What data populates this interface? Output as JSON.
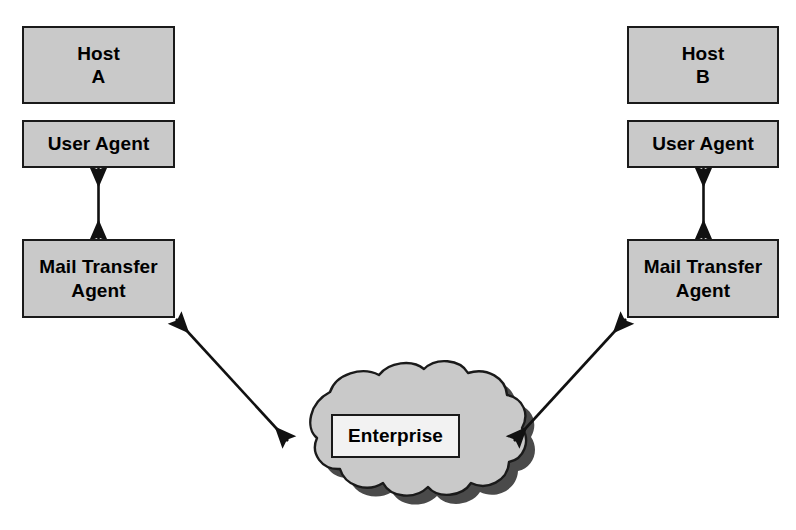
{
  "diagram": {
    "colors": {
      "box_fill": "#c9c9c9",
      "box_border": "#1a1a1a",
      "cloud_fill": "#c9c9c9",
      "cloud_border": "#1a1a1a",
      "cloud_shadow": "#4a4a4a",
      "enterprise_fill": "#f2f2f2",
      "arrow": "#111111",
      "background": "#ffffff"
    },
    "left_stack": {
      "host": {
        "label": "Host\nA",
        "name": "Host A"
      },
      "user_agent": {
        "label": "User Agent"
      },
      "mail_transfer_agent": {
        "label": "Mail Transfer\nAgent"
      }
    },
    "right_stack": {
      "host": {
        "label": "Host\nB",
        "name": "Host B"
      },
      "user_agent": {
        "label": "User Agent"
      },
      "mail_transfer_agent": {
        "label": "Mail Transfer\nAgent"
      }
    },
    "network": {
      "cloud_label": "Enterprise",
      "shape": "cloud"
    },
    "connections": [
      {
        "id": "ua-a-to-mta-a",
        "from": "User Agent (Host A)",
        "to": "Mail Transfer Agent (Host A)",
        "style": "double-headed-arrow",
        "orientation": "vertical"
      },
      {
        "id": "mta-a-to-cloud",
        "from": "Mail Transfer Agent (Host A)",
        "to": "Enterprise cloud",
        "style": "double-headed-arrow",
        "orientation": "diagonal"
      },
      {
        "id": "ua-b-to-mta-b",
        "from": "User Agent (Host B)",
        "to": "Mail Transfer Agent (Host B)",
        "style": "double-headed-arrow",
        "orientation": "vertical"
      },
      {
        "id": "mta-b-to-cloud",
        "from": "Mail Transfer Agent (Host B)",
        "to": "Enterprise cloud",
        "style": "double-headed-arrow",
        "orientation": "diagonal"
      }
    ]
  }
}
